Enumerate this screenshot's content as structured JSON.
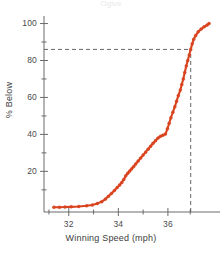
{
  "chart_data": {
    "type": "line",
    "title": "Ogive",
    "xlabel": "Winning Speed (mph)",
    "ylabel": "% Below",
    "xlim": [
      31.0,
      37.9
    ],
    "ylim": [
      -2,
      103
    ],
    "grid": false,
    "legend": "none",
    "series": [
      {
        "name": "Cumulative percent below",
        "color": "#d9431f",
        "marker": "circle",
        "x": [
          31.4,
          31.62,
          31.85,
          32.1,
          32.4,
          32.72,
          32.95,
          33.15,
          33.33,
          33.48,
          33.6,
          33.72,
          33.84,
          33.95,
          34.05,
          34.14,
          34.22,
          34.3,
          34.38,
          34.46,
          34.54,
          34.62,
          34.7,
          34.8,
          34.9,
          35.0,
          35.1,
          35.2,
          35.3,
          35.4,
          35.5,
          35.6,
          35.7,
          35.8,
          35.9,
          35.98,
          36.05,
          36.12,
          36.2,
          36.28,
          36.35,
          36.42,
          36.5,
          36.56,
          36.62,
          36.68,
          36.74,
          36.8,
          36.86,
          36.92,
          36.98,
          37.04,
          37.12,
          37.22,
          37.34,
          37.46,
          37.58,
          37.66
        ],
        "y": [
          0.6,
          0.6,
          0.7,
          0.8,
          1.0,
          1.4,
          1.8,
          2.6,
          3.6,
          5.0,
          6.5,
          8.0,
          9.6,
          11.2,
          12.6,
          14.0,
          15.6,
          17.6,
          19.0,
          20.2,
          21.4,
          22.6,
          24.0,
          25.6,
          27.2,
          28.8,
          30.4,
          32.0,
          33.6,
          35.2,
          36.6,
          38.0,
          39.0,
          39.6,
          40.2,
          43.0,
          46.0,
          49.0,
          52.0,
          55.0,
          58.0,
          61.0,
          64.0,
          67.0,
          70.0,
          73.5,
          77.0,
          80.0,
          83.0,
          86.0,
          89.0,
          91.5,
          93.5,
          95.5,
          97.0,
          98.2,
          99.2,
          100.0
        ]
      }
    ],
    "reference_lines": [
      {
        "name": "percentile-guide-horizontal",
        "orientation": "horizontal",
        "value": 86,
        "style": "dashed",
        "color": "#555555",
        "from": 31.0,
        "to": 36.92
      },
      {
        "name": "percentile-guide-vertical",
        "orientation": "vertical",
        "value": 36.92,
        "style": "dashed",
        "color": "#555555",
        "from": -2,
        "to": 86
      }
    ],
    "x_ticks_major": [
      32,
      34,
      36
    ],
    "x_tick_labels": [
      "32",
      "34",
      "36"
    ],
    "x_ticks_minor": [
      31.2,
      33,
      35,
      36.9
    ],
    "y_ticks_major": [
      20,
      40,
      60,
      80,
      100
    ],
    "y_tick_labels": [
      "20",
      "40",
      "60",
      "80",
      "100"
    ],
    "y_ticks_minor": [
      10,
      30,
      50,
      70,
      90
    ],
    "axis_color": "#6b6b6b"
  }
}
